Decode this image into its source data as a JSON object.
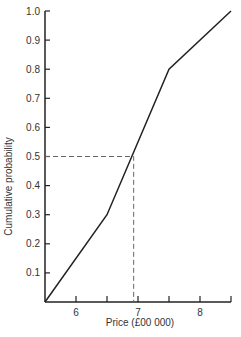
{
  "chart_data": {
    "type": "line",
    "title": "",
    "xlabel": "Price (£00 000)",
    "ylabel": "Cumulative probability",
    "xlim": [
      5.5,
      8.5
    ],
    "ylim": [
      0,
      1.0
    ],
    "grid": false,
    "legend": null,
    "x_ticks": [
      5.5,
      6,
      6.5,
      7,
      7.5,
      8,
      8.5
    ],
    "x_tick_labels": [
      {
        "value": 6,
        "label": "6"
      },
      {
        "value": 7,
        "label": "7"
      },
      {
        "value": 8,
        "label": "8"
      }
    ],
    "y_ticks": [
      0.1,
      0.2,
      0.3,
      0.4,
      0.5,
      0.6,
      0.7,
      0.8,
      0.9,
      1.0
    ],
    "y_tick_labels": [
      "0.1",
      "0.2",
      "0.3",
      "0.4",
      "0.5",
      "0.6",
      "0.7",
      "0.8",
      "0.9",
      "1.0"
    ],
    "series": [
      {
        "name": "Cumulative probability",
        "x": [
          5.5,
          6.5,
          7.5,
          8.5
        ],
        "y": [
          0.0,
          0.3,
          0.8,
          1.0
        ],
        "style": "solid",
        "color": "#222222"
      }
    ],
    "annotations": [
      {
        "type": "dashed-guide",
        "description": "Median reading: horizontal from y=0.5 to curve, then vertical down to x-axis",
        "y": 0.5,
        "x": 6.93,
        "color": "#555555"
      }
    ]
  },
  "axes": {
    "x_label": "Price (£00 000)",
    "y_label": "Cumulative probability"
  }
}
